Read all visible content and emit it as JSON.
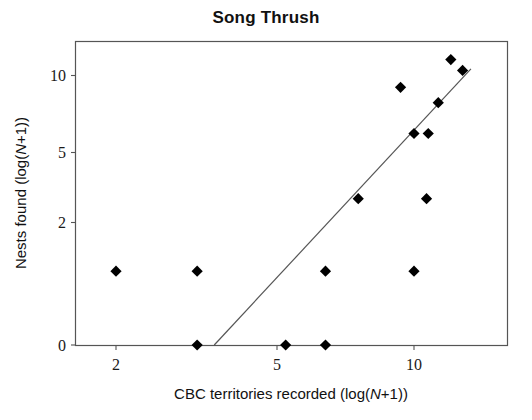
{
  "chart_data": {
    "type": "scatter",
    "title": "Song Thrush",
    "xlabel": "CBC territories recorded (log(N+1))",
    "ylabel": "Nests found (log(N+1))",
    "xlabel_parts": {
      "pre": "CBC territories recorded (log(",
      "italic": "N",
      "post": "+1))"
    },
    "ylabel_parts": {
      "pre": "Nests found (log(",
      "italic": "N",
      "post": "+1))"
    },
    "xticks": [
      2,
      5,
      10
    ],
    "xtick_labels": [
      "2",
      "5",
      "10"
    ],
    "yticks": [
      0,
      2,
      5,
      10
    ],
    "ytick_labels": [
      "0",
      "5",
      "2",
      "10"
    ],
    "ytick_labels_ordered": [
      "10",
      "5",
      "2",
      "0"
    ],
    "xscale": "log",
    "yscale": "log",
    "grid": false,
    "legend": null,
    "xlim": [
      1.7,
      13.6
    ],
    "ylim": [
      0,
      12.2
    ],
    "marker": "diamond",
    "marker_color": "#000000",
    "frame_color": "#555555",
    "line_color": "#555555",
    "points": [
      {
        "x": 2.0,
        "y": 1.2
      },
      {
        "x": 3.1,
        "y": 1.2
      },
      {
        "x": 3.1,
        "y": 0.0
      },
      {
        "x": 5.0,
        "y": 0.0
      },
      {
        "x": 6.2,
        "y": 0.0
      },
      {
        "x": 6.2,
        "y": 1.2
      },
      {
        "x": 7.4,
        "y": 3.0
      },
      {
        "x": 9.3,
        "y": 9.2
      },
      {
        "x": 10.0,
        "y": 1.2
      },
      {
        "x": 10.0,
        "y": 6.2
      },
      {
        "x": 10.7,
        "y": 3.0
      },
      {
        "x": 10.8,
        "y": 6.2
      },
      {
        "x": 11.4,
        "y": 8.2
      },
      {
        "x": 12.2,
        "y": 11.0
      },
      {
        "x": 13.0,
        "y": 10.3
      }
    ],
    "regression_line": {
      "x_start": 3.4,
      "y_start": 0.0,
      "x_end": 13.6,
      "y_end": 10.4,
      "label": "fitted regression line"
    }
  }
}
